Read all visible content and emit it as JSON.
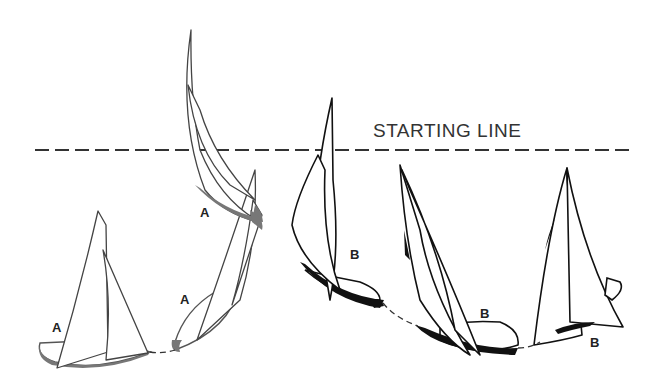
{
  "diagram": {
    "starting_line_label": "STARTING LINE",
    "line_style": "dashed",
    "boats": [
      {
        "id": "A1",
        "label": "A",
        "position": "bottom-left, starting tack"
      },
      {
        "id": "A2",
        "label": "A",
        "position": "bottom, bearing away"
      },
      {
        "id": "A3",
        "label": "A",
        "position": "crossing the line"
      },
      {
        "id": "B1",
        "label": "B",
        "position": "luffing near line"
      },
      {
        "id": "B2",
        "label": "B",
        "position": "bottom, bearing away"
      },
      {
        "id": "B3",
        "label": "B",
        "position": "bottom-right, starting tack"
      }
    ],
    "colors": {
      "boat_a_stroke": "#555555",
      "boat_b_stroke": "#111111",
      "background": "#ffffff"
    }
  }
}
